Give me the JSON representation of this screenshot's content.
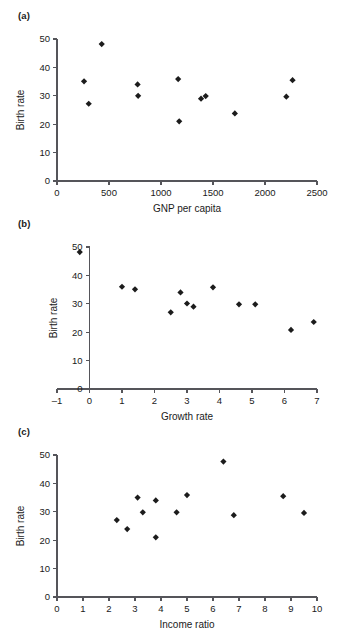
{
  "figure": {
    "background_color": "#ffffff",
    "marker_color": "#1c1c1c",
    "axis_color": "#55555a",
    "panels": [
      "(a)",
      "(b)",
      "(c)"
    ]
  },
  "panel_a": {
    "label": "(a)",
    "xlabel": "GNP per capita",
    "ylabel": "Birth rate",
    "xticks": [
      "0",
      "500",
      "1000",
      "1500",
      "2000",
      "2500"
    ],
    "yticks": [
      "0",
      "10",
      "20",
      "30",
      "40",
      "50"
    ]
  },
  "panel_b": {
    "label": "(b)",
    "xlabel": "Growth rate",
    "ylabel": "Birth rate",
    "xticks": [
      "-1",
      "0",
      "1",
      "2",
      "3",
      "4",
      "5",
      "6",
      "7"
    ],
    "yticks": [
      "0",
      "10",
      "20",
      "30",
      "40",
      "50"
    ]
  },
  "panel_c": {
    "label": "(c)",
    "xlabel": "Income ratio",
    "ylabel": "Birth rate",
    "xticks": [
      "0",
      "1",
      "2",
      "3",
      "4",
      "5",
      "6",
      "7",
      "8",
      "9",
      "10"
    ],
    "yticks": [
      "0",
      "10",
      "20",
      "30",
      "40",
      "50"
    ]
  },
  "chart_data": [
    {
      "type": "scatter",
      "panel": "(a)",
      "title": "",
      "xlabel": "GNP per capita",
      "ylabel": "Birth rate",
      "xlim": [
        0,
        2500
      ],
      "ylim": [
        0,
        50
      ],
      "xticks": [
        0,
        500,
        1000,
        1500,
        2000,
        2500
      ],
      "yticks": [
        0,
        10,
        20,
        30,
        40,
        50
      ],
      "grid": false,
      "legend": "none",
      "marker": "diamond",
      "points": [
        {
          "x": 260,
          "y": 35.1
        },
        {
          "x": 305,
          "y": 27.2
        },
        {
          "x": 430,
          "y": 48.2
        },
        {
          "x": 775,
          "y": 34.0
        },
        {
          "x": 780,
          "y": 30.0
        },
        {
          "x": 1165,
          "y": 35.9
        },
        {
          "x": 1175,
          "y": 21.0
        },
        {
          "x": 1385,
          "y": 29.0
        },
        {
          "x": 1430,
          "y": 29.9
        },
        {
          "x": 1710,
          "y": 23.8
        },
        {
          "x": 2205,
          "y": 29.7
        },
        {
          "x": 2265,
          "y": 35.5
        }
      ]
    },
    {
      "type": "scatter",
      "panel": "(b)",
      "title": "",
      "xlabel": "Growth rate",
      "ylabel": "Birth rate",
      "xlim": [
        -1,
        7
      ],
      "ylim": [
        0,
        50
      ],
      "xticks": [
        -1,
        0,
        1,
        2,
        3,
        4,
        5,
        6,
        7
      ],
      "yticks": [
        0,
        10,
        20,
        30,
        40,
        50
      ],
      "grid": false,
      "legend": "none",
      "marker": "diamond",
      "points": [
        {
          "x": -0.3,
          "y": 48.2
        },
        {
          "x": 1.0,
          "y": 36.0
        },
        {
          "x": 1.4,
          "y": 35.1
        },
        {
          "x": 2.5,
          "y": 27.0
        },
        {
          "x": 2.8,
          "y": 34.0
        },
        {
          "x": 3.0,
          "y": 30.1
        },
        {
          "x": 3.2,
          "y": 29.0
        },
        {
          "x": 3.8,
          "y": 35.8
        },
        {
          "x": 4.6,
          "y": 29.8
        },
        {
          "x": 5.1,
          "y": 29.8
        },
        {
          "x": 6.2,
          "y": 20.8
        },
        {
          "x": 6.9,
          "y": 23.6
        }
      ]
    },
    {
      "type": "scatter",
      "panel": "(c)",
      "title": "",
      "xlabel": "Income ratio",
      "ylabel": "Birth rate",
      "xlim": [
        0,
        10
      ],
      "ylim": [
        0,
        50
      ],
      "xticks": [
        0,
        1,
        2,
        3,
        4,
        5,
        6,
        7,
        8,
        9,
        10
      ],
      "yticks": [
        0,
        10,
        20,
        30,
        40,
        50
      ],
      "grid": false,
      "legend": "none",
      "marker": "diamond",
      "points": [
        {
          "x": 2.3,
          "y": 27.1
        },
        {
          "x": 2.7,
          "y": 23.9
        },
        {
          "x": 3.1,
          "y": 35.0
        },
        {
          "x": 3.3,
          "y": 29.8
        },
        {
          "x": 3.8,
          "y": 34.0
        },
        {
          "x": 3.8,
          "y": 21.0
        },
        {
          "x": 4.6,
          "y": 29.8
        },
        {
          "x": 5.0,
          "y": 35.9
        },
        {
          "x": 6.4,
          "y": 47.7
        },
        {
          "x": 6.8,
          "y": 28.8
        },
        {
          "x": 8.7,
          "y": 35.5
        },
        {
          "x": 9.5,
          "y": 29.6
        }
      ]
    }
  ]
}
